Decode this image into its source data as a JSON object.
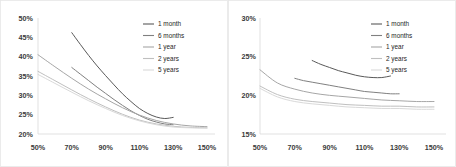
{
  "chart_data": [
    {
      "panel": "left",
      "type": "line",
      "title": "",
      "xlabel": "",
      "ylabel": "",
      "xlim": [
        50,
        150
      ],
      "ylim": [
        20,
        50
      ],
      "xticks": [
        "50%",
        "70%",
        "90%",
        "110%",
        "130%",
        "150%"
      ],
      "xtick_values": [
        50,
        70,
        90,
        110,
        130,
        150
      ],
      "yticks": [
        "20%",
        "25%",
        "30%",
        "35%",
        "40%",
        "45%",
        "50%"
      ],
      "ytick_values": [
        20,
        25,
        30,
        35,
        40,
        45,
        50
      ],
      "grid": false,
      "legend_position": "top-right",
      "series": [
        {
          "name": "1 month",
          "color": "#595959",
          "x": [
            70,
            75,
            80,
            85,
            90,
            95,
            100,
            105,
            110,
            115,
            120,
            125,
            130
          ],
          "values": [
            46.2,
            43.2,
            40.3,
            37.6,
            35.1,
            32.7,
            30.4,
            28.4,
            26.6,
            25.3,
            24.4,
            24.0,
            24.3
          ]
        },
        {
          "name": "6 months",
          "color": "#808080",
          "x": [
            70,
            75,
            80,
            85,
            90,
            95,
            100,
            105,
            110,
            115,
            120,
            125,
            130
          ],
          "values": [
            37.2,
            35.5,
            33.8,
            32.1,
            30.5,
            28.9,
            27.4,
            26.0,
            24.8,
            23.8,
            23.1,
            22.6,
            22.4
          ]
        },
        {
          "name": "1 year",
          "color": "#a6a6a6",
          "x": [
            50,
            60,
            70,
            80,
            90,
            100,
            110,
            120,
            130,
            140,
            150
          ],
          "values": [
            40.5,
            37.4,
            34.4,
            31.6,
            29.1,
            26.8,
            24.9,
            23.5,
            22.6,
            22.1,
            21.9
          ]
        },
        {
          "name": "2 years",
          "color": "#bfbfbf",
          "x": [
            50,
            60,
            70,
            80,
            90,
            100,
            110,
            120,
            130,
            140,
            150
          ],
          "values": [
            36.2,
            33.8,
            31.4,
            29.1,
            27.0,
            25.1,
            23.6,
            22.6,
            22.0,
            21.7,
            21.6
          ]
        },
        {
          "name": "5 years",
          "color": "#d9d9d9",
          "x": [
            50,
            60,
            70,
            80,
            90,
            100,
            110,
            120,
            130,
            140,
            150
          ],
          "values": [
            35.4,
            33.1,
            30.8,
            28.6,
            26.6,
            24.8,
            23.4,
            22.4,
            21.8,
            21.6,
            21.5
          ]
        }
      ]
    },
    {
      "panel": "right",
      "type": "line",
      "title": "",
      "xlabel": "",
      "ylabel": "",
      "xlim": [
        50,
        150
      ],
      "ylim": [
        15,
        30
      ],
      "xticks": [
        "50%",
        "70%",
        "90%",
        "110%",
        "130%",
        "150%"
      ],
      "xtick_values": [
        50,
        70,
        90,
        110,
        130,
        150
      ],
      "yticks": [
        "15%",
        "20%",
        "25%",
        "30%"
      ],
      "ytick_values": [
        15,
        20,
        25,
        30
      ],
      "grid": false,
      "legend_position": "top-right",
      "series": [
        {
          "name": "1 month",
          "color": "#595959",
          "x": [
            80,
            85,
            90,
            95,
            100,
            105,
            110,
            115,
            120,
            125
          ],
          "values": [
            24.5,
            24.0,
            23.6,
            23.2,
            22.9,
            22.6,
            22.4,
            22.3,
            22.3,
            22.5
          ]
        },
        {
          "name": "6 months",
          "color": "#808080",
          "x": [
            70,
            75,
            80,
            85,
            90,
            95,
            100,
            105,
            110,
            115,
            120,
            125,
            130
          ],
          "values": [
            22.2,
            21.9,
            21.7,
            21.5,
            21.3,
            21.1,
            20.9,
            20.7,
            20.5,
            20.4,
            20.3,
            20.2,
            20.2
          ]
        },
        {
          "name": "1 year",
          "color": "#a6a6a6",
          "x": [
            50,
            60,
            70,
            80,
            90,
            100,
            110,
            120,
            130,
            140,
            150
          ],
          "values": [
            23.3,
            21.6,
            20.8,
            20.3,
            20.0,
            19.8,
            19.6,
            19.4,
            19.3,
            19.2,
            19.2
          ]
        },
        {
          "name": "2 years",
          "color": "#bfbfbf",
          "x": [
            50,
            60,
            70,
            80,
            90,
            100,
            110,
            120,
            130,
            140,
            150
          ],
          "values": [
            21.2,
            20.1,
            19.5,
            19.2,
            19.0,
            18.8,
            18.7,
            18.6,
            18.6,
            18.5,
            18.5
          ]
        },
        {
          "name": "5 years",
          "color": "#d9d9d9",
          "x": [
            50,
            60,
            70,
            80,
            90,
            100,
            110,
            120,
            130,
            140,
            150
          ],
          "values": [
            20.9,
            19.8,
            19.2,
            18.9,
            18.7,
            18.5,
            18.4,
            18.3,
            18.3,
            18.2,
            18.2
          ]
        }
      ]
    }
  ],
  "left_chart": {
    "legend": [
      {
        "label": "1 month"
      },
      {
        "label": "6 months"
      },
      {
        "label": "1 year"
      },
      {
        "label": "2 years"
      },
      {
        "label": "5 years"
      }
    ]
  },
  "right_chart": {
    "legend": [
      {
        "label": "1 month"
      },
      {
        "label": "6 months"
      },
      {
        "label": "1 year"
      },
      {
        "label": "2 years"
      },
      {
        "label": "5 years"
      }
    ]
  },
  "colors": {
    "series_1": "#595959",
    "series_2": "#808080",
    "series_3": "#a6a6a6",
    "series_4": "#bfbfbf",
    "series_5": "#d9d9d9",
    "axis": "#d9d9d9",
    "tick_label": "#3a3a3a",
    "background": "#ffffff"
  }
}
